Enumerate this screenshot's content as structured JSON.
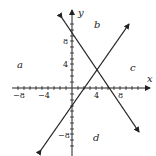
{
  "diagram": {
    "axes": {
      "x_label": "x",
      "y_label": "y"
    },
    "x_ticks": [
      {
        "value": -8,
        "label": "−8"
      },
      {
        "value": -4,
        "label": "−4"
      },
      {
        "value": 4,
        "label": "4"
      },
      {
        "value": 8,
        "label": "8"
      }
    ],
    "y_ticks": [
      {
        "value": 8,
        "label": "8"
      },
      {
        "value": 4,
        "label": "4"
      },
      {
        "value": -8,
        "label": "−8"
      }
    ],
    "regions": {
      "a": "a",
      "b": "b",
      "c": "c",
      "d": "d"
    },
    "lines": [
      {
        "name": "increasing-line",
        "through": [
          [
            2,
            0
          ],
          [
            4,
            3
          ]
        ]
      },
      {
        "name": "decreasing-line",
        "through": [
          [
            0,
            9
          ],
          [
            6,
            0
          ]
        ]
      }
    ]
  }
}
